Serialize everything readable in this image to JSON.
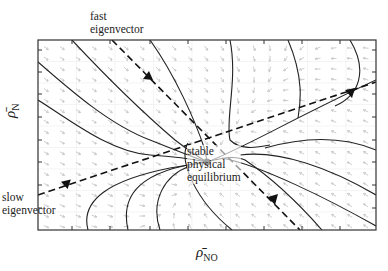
{
  "diagram": {
    "type": "phase-portrait",
    "x_axis_label": "ρ̄",
    "x_axis_subscript": "NO",
    "y_axis_label": "ρ̄",
    "y_axis_subscript": "N",
    "annotations": {
      "fast_eigenvector": [
        "fast",
        "eigenvector"
      ],
      "slow_eigenvector": [
        "slow",
        "eigenvector"
      ],
      "equilibrium": [
        "stable",
        "physical",
        "equilibrium"
      ]
    },
    "colors": {
      "frame": "#333333",
      "trajectory": "#222222",
      "field_arrow": "#b8b8b8",
      "grid": "#e6e6e6"
    }
  }
}
